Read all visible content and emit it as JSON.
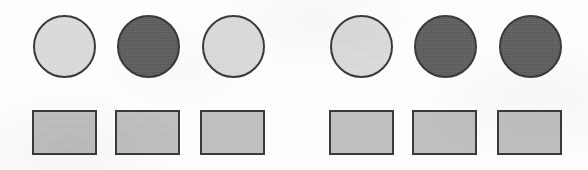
{
  "figure": {
    "background_color": "#fdfdfb",
    "width": 588,
    "height": 170
  },
  "palette": {
    "light_gray_fill": "#dcdcdc",
    "dark_gray_fill": "#5b5b5b",
    "rectangle_fill": "#bfbfbf",
    "outline": "#3a3a3a",
    "background": "#fdfdfb"
  },
  "groups": [
    {
      "name": "left-group",
      "circles": [
        {
          "label": "circle-1",
          "shade": "light",
          "fill": "#dcdcdc",
          "x": 33,
          "y": 15,
          "size": 63
        },
        {
          "label": "circle-2",
          "shade": "dark",
          "fill": "#5b5b5b",
          "x": 117,
          "y": 15,
          "size": 63
        },
        {
          "label": "circle-3",
          "shade": "light",
          "fill": "#dcdcdc",
          "x": 202,
          "y": 15,
          "size": 63
        }
      ],
      "rectangles": [
        {
          "label": "rect-1",
          "shade": "medium",
          "fill": "#bfbfbf",
          "x": 32,
          "y": 110,
          "width": 65,
          "height": 45
        },
        {
          "label": "rect-2",
          "shade": "medium",
          "fill": "#bfbfbf",
          "x": 115,
          "y": 110,
          "width": 65,
          "height": 45
        },
        {
          "label": "rect-3",
          "shade": "medium",
          "fill": "#bfbfbf",
          "x": 200,
          "y": 110,
          "width": 65,
          "height": 45
        }
      ]
    },
    {
      "name": "right-group",
      "circles": [
        {
          "label": "circle-4",
          "shade": "light",
          "fill": "#dcdcdc",
          "x": 330,
          "y": 15,
          "size": 63
        },
        {
          "label": "circle-5",
          "shade": "dark",
          "fill": "#5b5b5b",
          "x": 414,
          "y": 15,
          "size": 63
        },
        {
          "label": "circle-6",
          "shade": "dark",
          "fill": "#5b5b5b",
          "x": 499,
          "y": 15,
          "size": 63
        }
      ],
      "rectangles": [
        {
          "label": "rect-4",
          "shade": "medium",
          "fill": "#bfbfbf",
          "x": 329,
          "y": 110,
          "width": 65,
          "height": 45
        },
        {
          "label": "rect-5",
          "shade": "medium",
          "fill": "#bfbfbf",
          "x": 412,
          "y": 110,
          "width": 65,
          "height": 45
        },
        {
          "label": "rect-6",
          "shade": "medium",
          "fill": "#bfbfbf",
          "x": 497,
          "y": 110,
          "width": 65,
          "height": 45
        }
      ]
    }
  ]
}
